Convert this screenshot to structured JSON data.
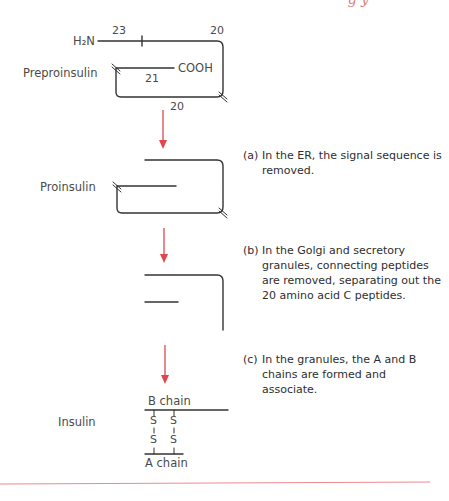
{
  "figure": {
    "header_fragment": "g y",
    "accent_color": "#e0474c",
    "stages": [
      {
        "label": "Preproinsulin",
        "amine_terminus": "H₂N",
        "carboxyl_terminus": "COOH",
        "segment_counts": {
          "signal": "23",
          "b_segment": "20",
          "c_peptide": "20",
          "a_segment": "21"
        }
      },
      {
        "label": "Proinsulin"
      },
      {
        "label": ""
      },
      {
        "label": "Insulin",
        "b_chain": "B chain",
        "a_chain": "A chain",
        "disulfide_atom": "S"
      }
    ],
    "captions": [
      {
        "tag": "(a)",
        "text": "In the ER, the signal sequence is removed."
      },
      {
        "tag": "(b)",
        "text": "In the Golgi and secretory granules, connecting peptides are removed, separating out the 20 amino acid C peptides."
      },
      {
        "tag": "(c)",
        "text": "In the granules, the A and B chains are formed and associate."
      }
    ]
  }
}
